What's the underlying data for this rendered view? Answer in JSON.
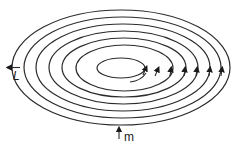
{
  "diagram": {
    "type": "nested elliptical spiral with flow arrows",
    "stroke_color": "#2b2b2b",
    "rings": [
      {
        "cx": 121,
        "cy": 67.5,
        "rx": 109,
        "ry": 57.5
      },
      {
        "cx": 122.5,
        "cy": 67.5,
        "rx": 98.5,
        "ry": 50.5
      },
      {
        "cx": 123,
        "cy": 67.5,
        "rx": 87,
        "ry": 43.5
      },
      {
        "cx": 123.5,
        "cy": 67.5,
        "rx": 74.5,
        "ry": 36.5
      },
      {
        "cx": 124,
        "cy": 67.5,
        "rx": 62,
        "ry": 29.5
      },
      {
        "cx": 124.5,
        "cy": 68,
        "rx": 48.5,
        "ry": 23
      },
      {
        "cx": 121,
        "cy": 68,
        "rx": 24,
        "ry": 10
      }
    ],
    "ring_arrows": [
      {
        "x": 146,
        "y": 71,
        "direction": "up-right"
      },
      {
        "x": 158,
        "y": 72,
        "direction": "up-right"
      },
      {
        "x": 171,
        "y": 72,
        "direction": "up"
      },
      {
        "x": 185,
        "y": 72,
        "direction": "up"
      },
      {
        "x": 197,
        "y": 72,
        "direction": "up"
      },
      {
        "x": 210,
        "y": 72,
        "direction": "up"
      },
      {
        "x": 222,
        "y": 72,
        "direction": "up"
      }
    ],
    "labels": {
      "left_arrow": "L",
      "bottom_arrow": "m"
    }
  }
}
